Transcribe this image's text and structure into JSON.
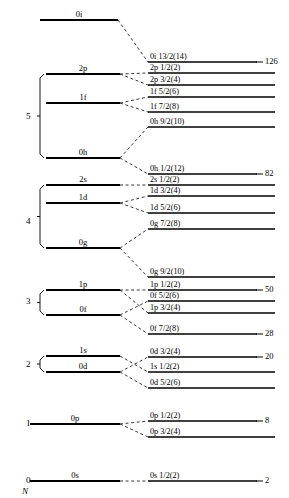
{
  "figure": {
    "axis_label": "N",
    "colors": {
      "line": "#000000",
      "dashed": "#222222",
      "background": "#ffffff"
    }
  },
  "chart_data": {
    "type": "diagram",
    "xlabel": "",
    "ylabel": "N",
    "grid": false,
    "legend_position": "none",
    "oscillator_shells": [
      {
        "n": "5",
        "n_y": 117,
        "bracket_top": 74,
        "bracket_bottom": 158,
        "levels": [
          {
            "label": "2p",
            "x1": 46,
            "x2": 120,
            "y": 74
          },
          {
            "label": "1f",
            "x1": 46,
            "x2": 120,
            "y": 103
          },
          {
            "label": "0h",
            "x1": 46,
            "x2": 120,
            "y": 158
          }
        ]
      },
      {
        "n": "4",
        "n_y": 222,
        "bracket_top": 185,
        "bracket_bottom": 248,
        "levels": [
          {
            "label": "2s",
            "x1": 46,
            "x2": 120,
            "y": 185
          },
          {
            "label": "1d",
            "x1": 46,
            "x2": 120,
            "y": 203
          },
          {
            "label": "0g",
            "x1": 46,
            "x2": 120,
            "y": 248
          }
        ]
      },
      {
        "n": "3",
        "n_y": 302,
        "bracket_top": 290,
        "bracket_bottom": 315,
        "levels": [
          {
            "label": "1p",
            "x1": 46,
            "x2": 120,
            "y": 290
          },
          {
            "label": "0f",
            "x1": 46,
            "x2": 120,
            "y": 315
          }
        ]
      },
      {
        "n": "2",
        "n_y": 365,
        "bracket_top": 356,
        "bracket_bottom": 372,
        "levels": [
          {
            "label": "1s",
            "x1": 46,
            "x2": 120,
            "y": 356
          },
          {
            "label": "0d",
            "x1": 46,
            "x2": 120,
            "y": 372
          }
        ]
      },
      {
        "n": "1",
        "n_y": 424,
        "bracket_top": null,
        "bracket_bottom": null,
        "levels": [
          {
            "label": "0p",
            "x1": 30,
            "x2": 120,
            "y": 424
          }
        ]
      },
      {
        "n": "0",
        "n_y": 481,
        "bracket_top": null,
        "bracket_bottom": null,
        "levels": [
          {
            "label": "0s",
            "x1": 30,
            "x2": 120,
            "y": 481
          }
        ]
      }
    ],
    "ungrouped_levels": [
      {
        "label": "0i",
        "x1": 40,
        "x2": 118,
        "y": 20
      }
    ],
    "split_levels": [
      {
        "label": "0i 13/2(14)",
        "y": 62,
        "x1": 148,
        "x2": 257,
        "parent": "0i"
      },
      {
        "label": "2p 1/2(2)",
        "y": 73,
        "x1": 148,
        "x2": 275,
        "parent": "2p"
      },
      {
        "label": "2p 3/2(4)",
        "y": 85,
        "x1": 148,
        "x2": 275,
        "parent": "2p"
      },
      {
        "label": "1f 5/2(6)",
        "y": 97,
        "x1": 148,
        "x2": 275,
        "parent": "1f"
      },
      {
        "label": "1f 7/2(8)",
        "y": 112,
        "x1": 148,
        "x2": 275,
        "parent": "1f"
      },
      {
        "label": "0h 9/2(10)",
        "y": 127,
        "x1": 148,
        "x2": 275,
        "parent": "0h"
      },
      {
        "label": "0h 1/2(12)",
        "y": 174,
        "x1": 148,
        "x2": 257,
        "parent": "0h"
      },
      {
        "label": "2s 1/2(2)",
        "y": 185,
        "x1": 148,
        "x2": 275,
        "parent": "2s"
      },
      {
        "label": "1d 3/2(4)",
        "y": 196,
        "x1": 148,
        "x2": 275,
        "parent": "1d"
      },
      {
        "label": "1d 5/2(6)",
        "y": 213,
        "x1": 148,
        "x2": 275,
        "parent": "1d"
      },
      {
        "label": "0g 7/2(8)",
        "y": 229,
        "x1": 148,
        "x2": 275,
        "parent": "0g"
      },
      {
        "label": "0g 9/2(10)",
        "y": 277,
        "x1": 148,
        "x2": 275,
        "parent": "0g"
      },
      {
        "label": "1p 1/2(2)",
        "y": 290,
        "x1": 148,
        "x2": 257,
        "parent": "1p"
      },
      {
        "label": "0f 5/2(6)",
        "y": 301,
        "x1": 148,
        "x2": 275,
        "parent": "0f"
      },
      {
        "label": "1p 3/2(4)",
        "y": 313,
        "x1": 148,
        "x2": 275,
        "parent": "1p"
      },
      {
        "label": "0f 7/2(8)",
        "y": 334,
        "x1": 148,
        "x2": 257,
        "parent": "0f"
      },
      {
        "label": "0d 3/2(4)",
        "y": 357,
        "x1": 148,
        "x2": 257,
        "parent": "0d"
      },
      {
        "label": "1s 1/2(2)",
        "y": 372,
        "x1": 148,
        "x2": 275,
        "parent": "1s"
      },
      {
        "label": "0d 5/2(6)",
        "y": 388,
        "x1": 148,
        "x2": 275,
        "parent": "0d"
      },
      {
        "label": "0p 1/2(2)",
        "y": 421,
        "x1": 148,
        "x2": 257,
        "parent": "0p"
      },
      {
        "label": "0p 3/2(4)",
        "y": 437,
        "x1": 148,
        "x2": 275,
        "parent": "0p"
      },
      {
        "label": "0s 1/2(2)",
        "y": 481,
        "x1": 148,
        "x2": 257,
        "parent": "0s"
      }
    ],
    "magic_numbers": [
      {
        "value": "126",
        "y": 62,
        "x": 260
      },
      {
        "value": "82",
        "y": 174,
        "x": 260
      },
      {
        "value": "50",
        "y": 290,
        "x": 260
      },
      {
        "value": "28",
        "y": 334,
        "x": 260
      },
      {
        "value": "20",
        "y": 357,
        "x": 260
      },
      {
        "value": "8",
        "y": 421,
        "x": 260
      },
      {
        "value": "2",
        "y": 481,
        "x": 260
      }
    ],
    "connectors": [
      {
        "from": "0i",
        "fx": 118,
        "fy": 20,
        "tx": 148,
        "ty": 62
      },
      {
        "from": "2p",
        "fx": 120,
        "fy": 74,
        "tx": 148,
        "ty": 73
      },
      {
        "from": "2p",
        "fx": 120,
        "fy": 74,
        "tx": 148,
        "ty": 85
      },
      {
        "from": "1f",
        "fx": 120,
        "fy": 103,
        "tx": 148,
        "ty": 97
      },
      {
        "from": "1f",
        "fx": 120,
        "fy": 103,
        "tx": 148,
        "ty": 112
      },
      {
        "from": "0h",
        "fx": 120,
        "fy": 158,
        "tx": 148,
        "ty": 127
      },
      {
        "from": "0h",
        "fx": 120,
        "fy": 158,
        "tx": 148,
        "ty": 174
      },
      {
        "from": "2s",
        "fx": 120,
        "fy": 185,
        "tx": 148,
        "ty": 185
      },
      {
        "from": "1d",
        "fx": 120,
        "fy": 203,
        "tx": 148,
        "ty": 196
      },
      {
        "from": "1d",
        "fx": 120,
        "fy": 203,
        "tx": 148,
        "ty": 213
      },
      {
        "from": "0g",
        "fx": 120,
        "fy": 248,
        "tx": 148,
        "ty": 229
      },
      {
        "from": "0g",
        "fx": 120,
        "fy": 248,
        "tx": 148,
        "ty": 277
      },
      {
        "from": "1p",
        "fx": 120,
        "fy": 290,
        "tx": 148,
        "ty": 290
      },
      {
        "from": "1p",
        "fx": 120,
        "fy": 290,
        "tx": 148,
        "ty": 313
      },
      {
        "from": "0f",
        "fx": 120,
        "fy": 315,
        "tx": 148,
        "ty": 301
      },
      {
        "from": "0f",
        "fx": 120,
        "fy": 315,
        "tx": 148,
        "ty": 334
      },
      {
        "from": "1s",
        "fx": 120,
        "fy": 356,
        "tx": 148,
        "ty": 372
      },
      {
        "from": "0d",
        "fx": 120,
        "fy": 372,
        "tx": 148,
        "ty": 357
      },
      {
        "from": "0d",
        "fx": 120,
        "fy": 372,
        "tx": 148,
        "ty": 388
      },
      {
        "from": "0p",
        "fx": 120,
        "fy": 424,
        "tx": 148,
        "ty": 421
      },
      {
        "from": "0p",
        "fx": 120,
        "fy": 424,
        "tx": 148,
        "ty": 437
      },
      {
        "from": "0s",
        "fx": 120,
        "fy": 481,
        "tx": 148,
        "ty": 481
      }
    ]
  }
}
